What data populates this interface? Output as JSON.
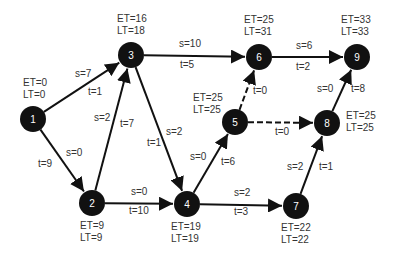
{
  "diagram": {
    "title": "",
    "type": "activity-on-arrow project network (PERT/CPM)",
    "colors": {
      "node_fill": "#111111",
      "node_text": "#ffffff",
      "edge": "#111111",
      "label": "#333333",
      "background": "#ffffff"
    },
    "nodes": [
      {
        "id": "1",
        "label": "1",
        "x": 33,
        "y": 119,
        "et": "ET=0",
        "lt": "LT=0",
        "lbl_x": 23,
        "lbl_y": 86,
        "anchor": "start"
      },
      {
        "id": "2",
        "label": "2",
        "x": 92,
        "y": 203,
        "et": "ET=9",
        "lt": "LT=9",
        "lbl_x": 80,
        "lbl_y": 229,
        "anchor": "start"
      },
      {
        "id": "3",
        "label": "3",
        "x": 131,
        "y": 55,
        "et": "ET=16",
        "lt": "LT=18",
        "lbl_x": 117,
        "lbl_y": 22,
        "anchor": "start"
      },
      {
        "id": "4",
        "label": "4",
        "x": 187,
        "y": 204,
        "et": "ET=19",
        "lt": "LT=19",
        "lbl_x": 171,
        "lbl_y": 230,
        "anchor": "start"
      },
      {
        "id": "5",
        "label": "5",
        "x": 235,
        "y": 122,
        "et": "ET=25",
        "lt": "LT=25",
        "lbl_x": 193,
        "lbl_y": 101,
        "anchor": "start"
      },
      {
        "id": "6",
        "label": "6",
        "x": 259,
        "y": 57,
        "et": "ET=25",
        "lt": "LT=31",
        "lbl_x": 244,
        "lbl_y": 23,
        "anchor": "start"
      },
      {
        "id": "7",
        "label": "7",
        "x": 296,
        "y": 206,
        "et": "ET=22",
        "lt": "LT=22",
        "lbl_x": 281,
        "lbl_y": 231,
        "anchor": "start"
      },
      {
        "id": "8",
        "label": "8",
        "x": 327,
        "y": 123,
        "et": "ET=25",
        "lt": "LT=25",
        "lbl_x": 346,
        "lbl_y": 119,
        "anchor": "start"
      },
      {
        "id": "9",
        "label": "9",
        "x": 357,
        "y": 57,
        "et": "ET=33",
        "lt": "LT=33",
        "lbl_x": 341,
        "lbl_y": 23,
        "anchor": "start"
      }
    ],
    "edges": [
      {
        "from": "1",
        "to": "3",
        "dashed": false,
        "s": "s=7",
        "t": "t=1",
        "s_pos": [
          75,
          77
        ],
        "t_pos": [
          88,
          95
        ]
      },
      {
        "from": "1",
        "to": "2",
        "dashed": false,
        "s": "s=0",
        "t": "t=9",
        "s_pos": [
          66,
          156
        ],
        "t_pos": [
          38,
          167
        ]
      },
      {
        "from": "2",
        "to": "3",
        "dashed": false,
        "s": "s=2",
        "t": "t=7",
        "s_pos": [
          94,
          121
        ],
        "t_pos": [
          120,
          127
        ]
      },
      {
        "from": "3",
        "to": "4",
        "dashed": false,
        "s": "s=2",
        "t": "t=1",
        "s_pos": [
          166,
          135
        ],
        "t_pos": [
          147,
          146
        ]
      },
      {
        "from": "3",
        "to": "6",
        "dashed": false,
        "s": "s=10",
        "t": "t=5",
        "s_pos": [
          179,
          47
        ],
        "t_pos": [
          180,
          68
        ]
      },
      {
        "from": "2",
        "to": "4",
        "dashed": false,
        "s": "s=0",
        "t": "t=10",
        "s_pos": [
          131,
          195
        ],
        "t_pos": [
          129,
          214
        ]
      },
      {
        "from": "4",
        "to": "5",
        "dashed": false,
        "s": "s=0",
        "t": "t=6",
        "s_pos": [
          190,
          160
        ],
        "t_pos": [
          221,
          165
        ]
      },
      {
        "from": "4",
        "to": "7",
        "dashed": false,
        "s": "s=2",
        "t": "t=3",
        "s_pos": [
          234,
          196
        ],
        "t_pos": [
          234,
          215
        ]
      },
      {
        "from": "5",
        "to": "6",
        "dashed": true,
        "s": "",
        "t": "t=0",
        "s_pos": [
          0,
          0
        ],
        "t_pos": [
          253,
          94
        ]
      },
      {
        "from": "5",
        "to": "8",
        "dashed": true,
        "s": "",
        "t": "t=0",
        "s_pos": [
          0,
          0
        ],
        "t_pos": [
          275,
          135
        ]
      },
      {
        "from": "6",
        "to": "9",
        "dashed": false,
        "s": "s=6",
        "t": "t=2",
        "s_pos": [
          296,
          49
        ],
        "t_pos": [
          296,
          70
        ]
      },
      {
        "from": "7",
        "to": "8",
        "dashed": false,
        "s": "s=2",
        "t": "t=1",
        "s_pos": [
          287,
          170
        ],
        "t_pos": [
          319,
          170
        ]
      },
      {
        "from": "8",
        "to": "9",
        "dashed": false,
        "s": "s=0",
        "t": "t=8",
        "s_pos": [
          317,
          92
        ],
        "t_pos": [
          351,
          92
        ]
      }
    ]
  }
}
